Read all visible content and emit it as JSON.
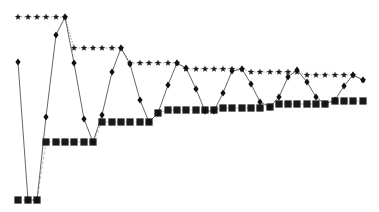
{
  "chart_data": {
    "type": "line",
    "title": "",
    "xlabel": "",
    "ylabel": "",
    "grid": false,
    "legend": null,
    "x": [
      1,
      2,
      3,
      4,
      5,
      6,
      7,
      8,
      9,
      10,
      11,
      12,
      13,
      14,
      15,
      16,
      17,
      18,
      19,
      20,
      21,
      22,
      23,
      24,
      25,
      26,
      27,
      28,
      29,
      30,
      31,
      32,
      33,
      34,
      35,
      36,
      37,
      38
    ],
    "pixel_x": [
      18,
      28,
      37,
      46,
      56,
      65,
      74,
      84,
      93,
      102,
      112,
      121,
      130,
      140,
      149,
      158,
      168,
      177,
      186,
      196,
      205,
      214,
      223,
      232,
      242,
      251,
      260,
      270,
      279,
      288,
      297,
      307,
      316,
      325,
      335,
      344,
      353,
      363
    ],
    "series": [
      {
        "name": "current",
        "marker": "diamond",
        "line": "solid",
        "pixel_y": [
          62,
          200,
          200,
          117,
          35,
          17,
          63,
          119,
          142,
          115,
          72,
          48,
          64,
          100,
          122,
          113,
          85,
          63,
          68,
          89,
          111,
          111,
          93,
          71,
          69,
          84,
          102,
          107,
          97,
          77,
          70,
          82,
          97,
          104,
          100,
          86,
          75,
          80
        ]
      },
      {
        "name": "running-max",
        "marker": "star",
        "line": "dotted",
        "pixel_y": [
          17,
          17,
          17,
          17,
          17,
          17,
          48,
          48,
          48,
          48,
          48,
          48,
          63,
          63,
          63,
          63,
          63,
          63,
          69,
          69,
          69,
          69,
          69,
          69,
          69,
          72,
          72,
          72,
          72,
          72,
          72,
          75,
          75,
          75,
          75,
          75,
          75,
          80
        ]
      },
      {
        "name": "running-min",
        "marker": "square",
        "line": "dashed",
        "pixel_y": [
          200,
          200,
          200,
          142,
          142,
          142,
          142,
          142,
          142,
          122,
          122,
          122,
          122,
          122,
          122,
          113,
          110,
          110,
          110,
          110,
          110,
          110,
          108,
          108,
          108,
          108,
          108,
          107,
          104,
          104,
          104,
          104,
          104,
          104,
          101,
          101,
          101,
          101
        ]
      }
    ]
  }
}
